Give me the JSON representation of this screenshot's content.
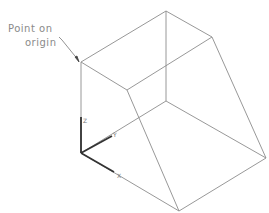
{
  "annotation": {
    "line1": "Point on",
    "line2": "origin"
  },
  "axes": {
    "z_label": "Z",
    "y_label": "Y",
    "x_label": "X"
  },
  "colors": {
    "edge": "#8c8c8c",
    "axis": "#333333",
    "text": "#8a8a8a"
  }
}
